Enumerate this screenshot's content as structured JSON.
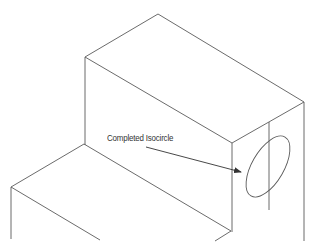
{
  "figure": {
    "type": "isometric-drawing",
    "annotation": {
      "label": "Completed Isocircle",
      "position": {
        "x": 107,
        "y": 133
      },
      "arrow": {
        "from": [
          146,
          147
        ],
        "to": [
          241,
          172
        ]
      }
    },
    "colors": {
      "line": "#5a5a5a",
      "text": "#333333",
      "background": "#ffffff"
    },
    "edges": [
      {
        "name": "upper-top-back-left",
        "from": [
          85,
          57
        ],
        "to": [
          158,
          14
        ]
      },
      {
        "name": "upper-top-back-right",
        "from": [
          158,
          14
        ],
        "to": [
          304,
          102
        ]
      },
      {
        "name": "upper-top-front-left",
        "from": [
          85,
          57
        ],
        "to": [
          232,
          143
        ]
      },
      {
        "name": "upper-top-front-right",
        "from": [
          232,
          143
        ],
        "to": [
          304,
          102
        ]
      },
      {
        "name": "upper-left-vertical",
        "from": [
          85,
          57
        ],
        "to": [
          85,
          145
        ]
      },
      {
        "name": "front-vertical",
        "from": [
          232,
          143
        ],
        "to": [
          232,
          232
        ]
      },
      {
        "name": "right-vertical",
        "from": [
          304,
          102
        ],
        "to": [
          304,
          241
        ]
      },
      {
        "name": "center-line-vertical",
        "from": [
          269,
          122
        ],
        "to": [
          269,
          210
        ]
      },
      {
        "name": "lower-top-back-left",
        "from": [
          11,
          187
        ],
        "to": [
          84,
          144
        ]
      },
      {
        "name": "lower-top-back-right",
        "from": [
          84,
          144
        ],
        "to": [
          231,
          231
        ]
      },
      {
        "name": "lower-front-diagonal",
        "from": [
          11,
          187
        ],
        "to": [
          100,
          240
        ]
      },
      {
        "name": "lower-left-vertical",
        "from": [
          11,
          187
        ],
        "to": [
          11,
          239
        ]
      },
      {
        "name": "lower-step-stub",
        "from": [
          231,
          231
        ],
        "to": [
          215,
          241
        ]
      }
    ],
    "isocircle": {
      "cx": 268,
      "cy": 166.5,
      "rx": 16,
      "ry": 34,
      "rotate": 30
    }
  }
}
